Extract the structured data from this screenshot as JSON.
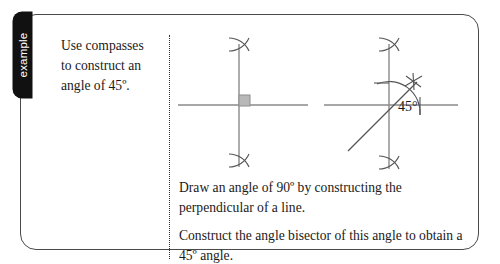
{
  "card": {
    "tab_label": "example"
  },
  "prompt": {
    "line1": "Use compasses",
    "line2": "to construct an",
    "line3": "angle of 45º."
  },
  "instructions": {
    "step1": "Draw an angle of 90º by constructing the perpendicular of a line.",
    "step2": "Construct the angle bisector of this angle to obtain a 45º angle."
  },
  "diagram": {
    "angle_label": "45°",
    "line_color": "#8a8a8a",
    "construction_color": "#555555",
    "right_angle_fill": "#b8b8b8",
    "figure1_name": "perpendicular-construction",
    "figure2_name": "angle-bisector-construction"
  }
}
